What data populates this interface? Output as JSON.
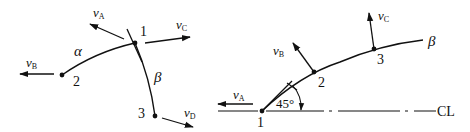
{
  "left_diagram": {
    "points": [
      {
        "label": "1",
        "x": 135,
        "y": 43
      },
      {
        "label": "2",
        "x": 62,
        "y": 75
      },
      {
        "label": "3",
        "x": 155,
        "y": 116
      }
    ],
    "curves": [
      {
        "label": "α",
        "from": "2",
        "to": "1"
      },
      {
        "label": "β",
        "from": "1",
        "to": "3"
      }
    ],
    "vectors": [
      {
        "name": "v",
        "sub": "A",
        "at": "1"
      },
      {
        "name": "v",
        "sub": "C",
        "at": "1"
      },
      {
        "name": "v",
        "sub": "B",
        "at": "2"
      },
      {
        "name": "v",
        "sub": "D",
        "at": "3"
      }
    ]
  },
  "right_diagram": {
    "points": [
      {
        "label": "1",
        "x": 262,
        "y": 111
      },
      {
        "label": "2",
        "x": 314,
        "y": 72
      },
      {
        "label": "3",
        "x": 374,
        "y": 49
      }
    ],
    "curve_label": "β",
    "angle_label": "45°",
    "centerline_label": "CL",
    "vectors": [
      {
        "name": "v",
        "sub": "A",
        "at": "1"
      },
      {
        "name": "v",
        "sub": "B",
        "at": "2"
      },
      {
        "name": "v",
        "sub": "C",
        "at": "3"
      }
    ]
  },
  "colors": {
    "ink": "#111111",
    "background": "#ffffff"
  }
}
